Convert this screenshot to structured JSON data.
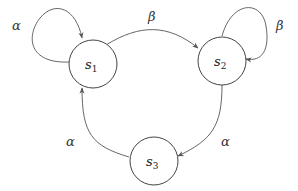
{
  "diagram": {
    "type": "state-transition",
    "states": [
      {
        "id": "s1",
        "name": "s",
        "subscript": "1"
      },
      {
        "id": "s2",
        "name": "s",
        "subscript": "2"
      },
      {
        "id": "s3",
        "name": "s",
        "subscript": "3"
      }
    ],
    "transitions": [
      {
        "from": "s1",
        "to": "s1",
        "label": "α"
      },
      {
        "from": "s1",
        "to": "s2",
        "label": "β"
      },
      {
        "from": "s2",
        "to": "s2",
        "label": "β"
      },
      {
        "from": "s2",
        "to": "s3",
        "label": "α"
      },
      {
        "from": "s3",
        "to": "s1",
        "label": "α"
      }
    ]
  }
}
